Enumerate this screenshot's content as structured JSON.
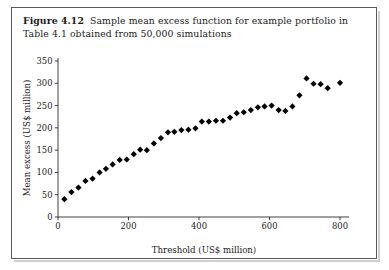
{
  "figure": {
    "label": "Figure 4.12",
    "caption": "Sample mean excess function for example portfolio in Table 4.1 obtained from 50,000 simulations"
  },
  "colors": {
    "marker": "#000000",
    "axis": "#2b2b2b",
    "frame": "#5a5a5a",
    "background": "#ffffff",
    "text": "#1b1b1b"
  },
  "chart_data": {
    "type": "scatter",
    "title": "",
    "subtitle": "",
    "xlabel": "Threshold (US$ million)",
    "ylabel": "Mean excess (US$ million)",
    "xlim": [
      0,
      830
    ],
    "ylim": [
      0,
      360
    ],
    "xticks": [
      0,
      200,
      400,
      600,
      800
    ],
    "xticklabels": [
      "0",
      "200",
      "400",
      "600",
      "800"
    ],
    "yticks": [
      0,
      50,
      100,
      150,
      200,
      250,
      300,
      350
    ],
    "yticklabels": [
      "0",
      "50",
      "100",
      "150",
      "200",
      "250",
      "300",
      "350"
    ],
    "grid": false,
    "legend": null,
    "marker": "diamond",
    "marker_size": 3.1,
    "series": [
      {
        "name": "Sample mean excess",
        "x": [
          18,
          38,
          58,
          78,
          98,
          118,
          136,
          155,
          175,
          195,
          215,
          233,
          252,
          272,
          292,
          312,
          330,
          350,
          370,
          390,
          408,
          428,
          448,
          468,
          488,
          507,
          527,
          547,
          567,
          586,
          606,
          626,
          645,
          665,
          685,
          705,
          725,
          745,
          765,
          800
        ],
        "y": [
          40,
          56,
          66,
          81,
          86,
          100,
          108,
          118,
          128,
          129,
          141,
          151,
          150,
          165,
          177,
          190,
          191,
          195,
          196,
          199,
          214,
          214,
          216,
          216,
          223,
          233,
          235,
          240,
          246,
          248,
          250,
          240,
          238,
          248,
          273,
          311,
          299,
          298,
          289,
          301
        ]
      }
    ]
  },
  "plot_geometry": {
    "origin_x_px": 58,
    "origin_y_px": 217,
    "x_px_per_unit": 0.3525,
    "y_px_per_unit": 0.4457,
    "x_axis_end_px": 349,
    "y_axis_top_px": 58
  }
}
